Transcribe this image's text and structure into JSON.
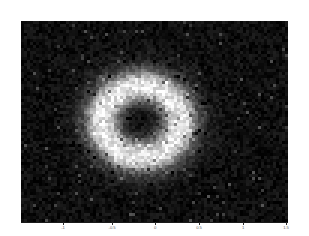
{
  "figure": {
    "background_color": "#ffffff",
    "plot_background_color": "#0b0b0b"
  },
  "axes": {
    "x_axis": {
      "name": "x-axis",
      "label": "",
      "line_color": "#1a1a1a",
      "ticks": [
        {
          "value": -1,
          "label": "-1",
          "pixel_x": 63
        },
        {
          "value": -0.5,
          "label": "-0.5",
          "pixel_x": 112
        },
        {
          "value": 0,
          "label": "0",
          "pixel_x": 155
        },
        {
          "value": 0.5,
          "label": "0.5",
          "pixel_x": 199
        },
        {
          "value": 1,
          "label": "1",
          "pixel_x": 243
        },
        {
          "value": 1.5,
          "label": "1.5",
          "pixel_x": 286
        }
      ]
    },
    "y_axis": {
      "name": "y-axis",
      "label": "",
      "ticks": []
    }
  },
  "chart_data": {
    "type": "heatmap",
    "title": "",
    "subtitle": "",
    "xlabel": "",
    "ylabel": "",
    "colormap": "gray",
    "grid": false,
    "legend": null,
    "colorbar": false,
    "xlim": [
      -1.25,
      1.53
    ],
    "ylim": [
      -1.05,
      1.05
    ],
    "xticks": [
      -1,
      -0.5,
      0,
      0.5,
      1,
      1.5
    ],
    "xticklabels": [
      "-1",
      "-0.5",
      "0",
      "0.5",
      "1",
      "1.5"
    ],
    "yticks": [],
    "yticklabels": [],
    "value_range": [
      0,
      255
    ],
    "radial_profile": {
      "radius_normalized": [
        0.0,
        0.1,
        0.2,
        0.3,
        0.4,
        0.5,
        0.6,
        0.7,
        0.8,
        0.9,
        1.0,
        1.2,
        1.5
      ],
      "intensity": [
        18,
        22,
        30,
        55,
        110,
        185,
        228,
        236,
        215,
        150,
        80,
        32,
        16
      ]
    },
    "ellipse": {
      "center_x": 0.0,
      "center_y": 0.0,
      "semi_axis_x": 0.6,
      "semi_axis_y": 0.55
    },
    "noise": {
      "type": "speckle",
      "amplitude": 60,
      "cell_size_px": 3
    }
  }
}
